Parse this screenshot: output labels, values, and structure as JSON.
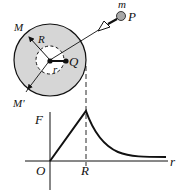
{
  "diagram": {
    "labels": {
      "mass": "m",
      "particle": "P",
      "shell_mark_top": "M",
      "shell_mark_bottom": "M'",
      "outer_radius": "R",
      "inner_radius": "r",
      "inner_point": "Q"
    },
    "graph": {
      "y_axis_label": "F",
      "x_axis_label": "r",
      "origin_label": "O",
      "peak_tick_label": "R"
    },
    "colors": {
      "shell_fill": "#d6d6d6",
      "ink": "#111111",
      "particle_fill": "#a8a8a8"
    }
  }
}
